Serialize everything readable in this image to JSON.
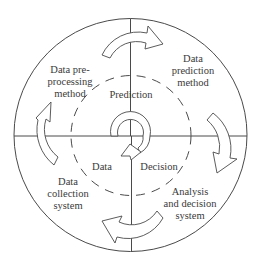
{
  "diagram": {
    "type": "cyclic-quadrant-diagram",
    "center_cycle": {
      "top_label": "Prediction",
      "bottom_left_label": "Data",
      "bottom_right_label": "Decision"
    },
    "quadrants": {
      "top_left": {
        "line1": "Data pre-",
        "line2": "processing",
        "line3": "method"
      },
      "top_right": {
        "line1": "Data",
        "line2": "prediction",
        "line3": "method"
      },
      "bottom_left": {
        "line1": "Data",
        "line2": "collection",
        "line3": "system"
      },
      "bottom_right": {
        "line1": "Analysis",
        "line2": "and decision",
        "line3": "system"
      }
    },
    "flow_direction": "clockwise",
    "arrows": [
      "top-arrow-right",
      "right-arrow-down",
      "bottom-arrow-left",
      "left-arrow-up"
    ],
    "colors": {
      "line": "#4a4a4a",
      "text": "#3a3a3a",
      "background": "#ffffff"
    }
  }
}
